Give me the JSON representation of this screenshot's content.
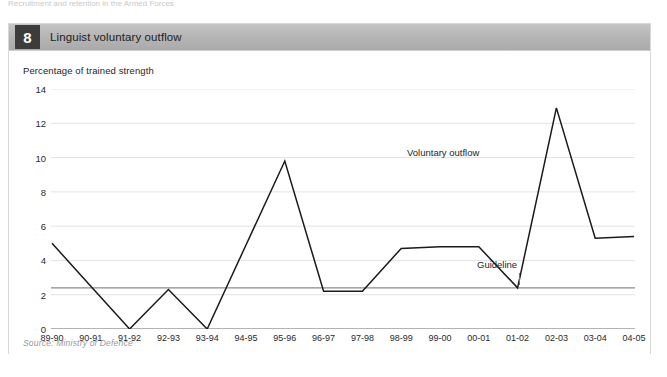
{
  "top_sliver_text": "Recruitment and retention in the Armed Forces",
  "figure": {
    "number": "8",
    "title": "Linguist voluntary outflow",
    "subtitle": "Percentage of trained strength",
    "source": "Source: Ministry of Defence"
  },
  "annotations": {
    "series_label": "Voluntary outflow",
    "guideline_label": "Guideline"
  },
  "colors": {
    "header_bar": "#b6b6b6",
    "number_badge": "#3c3c3c",
    "series_line": "#1a1a1a",
    "guideline_line": "#8d8d8d",
    "gridline": "#e2e2e2",
    "axis_line": "#9a9a9a",
    "source_text": "#9a9a9a"
  },
  "chart_data": {
    "type": "line",
    "title": "Linguist voluntary outflow",
    "subtitle": "Percentage of trained strength",
    "xlabel": "",
    "ylabel": "Percentage of trained strength",
    "ylim": [
      0,
      14
    ],
    "yticks": [
      0,
      2,
      4,
      6,
      8,
      10,
      12,
      14
    ],
    "ytick_labels": [
      "0",
      "2",
      "4",
      "6",
      "8",
      "10",
      "12",
      "14"
    ],
    "grid": true,
    "legend": "annotated",
    "categories": [
      "89-90",
      "90-91",
      "91-92",
      "92-93",
      "93-94",
      "94-95",
      "95-96",
      "96-97",
      "97-98",
      "98-99",
      "99-00",
      "00-01",
      "01-02",
      "02-03",
      "03-04",
      "04-05"
    ],
    "series": [
      {
        "name": "Voluntary outflow",
        "values": [
          5.0,
          2.5,
          0.0,
          2.3,
          0.0,
          4.9,
          9.8,
          2.2,
          2.2,
          4.7,
          4.8,
          4.8,
          2.4,
          12.9,
          5.3,
          5.4
        ]
      }
    ],
    "reference_lines": [
      {
        "name": "Guideline",
        "value": 2.4,
        "orientation": "horizontal"
      }
    ]
  }
}
